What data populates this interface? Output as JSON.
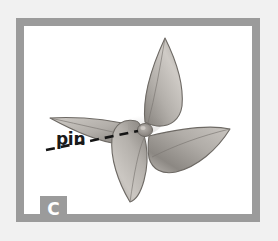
{
  "figure": {
    "panel_letter": "C",
    "background_color": "#f1f1f1",
    "frame_color": "#9b9b9b",
    "paper_color": "#ffffff",
    "style": "pencil-shaded line illustration, grayscale"
  },
  "callouts": [
    {
      "label": "pin",
      "target": "pinwheel-center-hub",
      "leader_style": "dashed",
      "leader_color": "#151515"
    }
  ],
  "pinwheel": {
    "blade_count": 4,
    "blade_fill": "#b6b2ad",
    "blade_outline": "#6f6b67",
    "hub_color": "#9a958f",
    "center": {
      "x": 145,
      "y": 122
    }
  },
  "colors": {
    "frame": "#9b9b9b",
    "badge_bg": "#9b9b9b",
    "badge_text": "#ffffff",
    "label_text": "#1a1a1a",
    "page_bg": "#f1f1f1"
  }
}
